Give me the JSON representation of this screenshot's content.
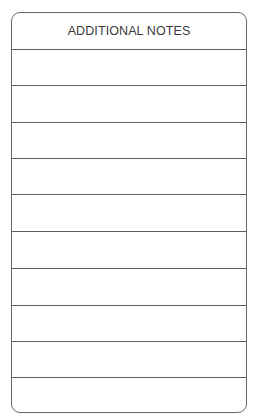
{
  "form": {
    "title": "ADDITIONAL NOTES",
    "line_count": 10,
    "lines": [
      "",
      "",
      "",
      "",
      "",
      "",
      "",
      "",
      "",
      ""
    ],
    "border_color": "#6a6a6a"
  }
}
